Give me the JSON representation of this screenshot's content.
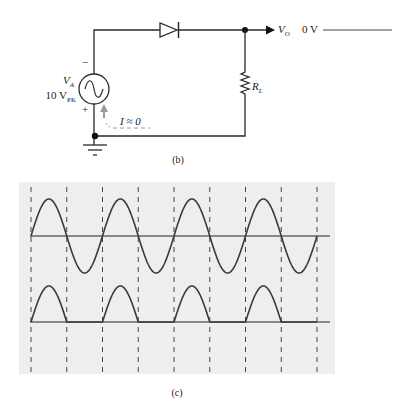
{
  "circuit": {
    "caption": "(b)",
    "source": {
      "name_main": "V",
      "name_sub": "A",
      "amplitude_main": "10 V",
      "amplitude_sub": "PK",
      "minus_sign": "−",
      "plus_sign": "+"
    },
    "load": {
      "name_main": "R",
      "name_sub": "L"
    },
    "output": {
      "name_main": "V",
      "name_sub": "O",
      "value": "0 V"
    },
    "current_annotation": "I ≈ 0"
  },
  "waveforms": {
    "caption": "(c)",
    "panel_color": "#eeeeee",
    "trace_color": "#3a3a3a",
    "baseline_color": "#666666"
  },
  "chart_data": {
    "type": "line",
    "title": "(c)",
    "series": [
      {
        "name": "Input V_A (sine)",
        "cycles": 4,
        "shape": "full sine",
        "peak_relative": 1.0
      },
      {
        "name": "Output V_O (half-wave rectified)",
        "cycles": 4,
        "shape": "positive half-cycles only",
        "peak_relative": 1.0
      }
    ],
    "grid": {
      "vertical_dashed_lines": 9,
      "horizontal_lines": 2
    },
    "xlabel": "",
    "ylabel": ""
  }
}
